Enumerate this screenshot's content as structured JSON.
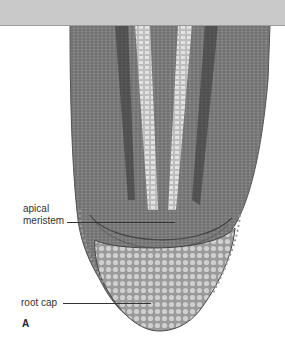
{
  "figure": {
    "panel_letter": "A",
    "labels": {
      "apical_meristem_line1": "apical",
      "apical_meristem_line2": "meristem",
      "root_cap": "root cap"
    },
    "colors": {
      "top_band": "#c9c9c9",
      "background": "#ffffff",
      "tissue_dark": "#3a3a3a",
      "tissue_mid": "#7a7a7a",
      "tissue_light": "#c8c8c8"
    }
  }
}
